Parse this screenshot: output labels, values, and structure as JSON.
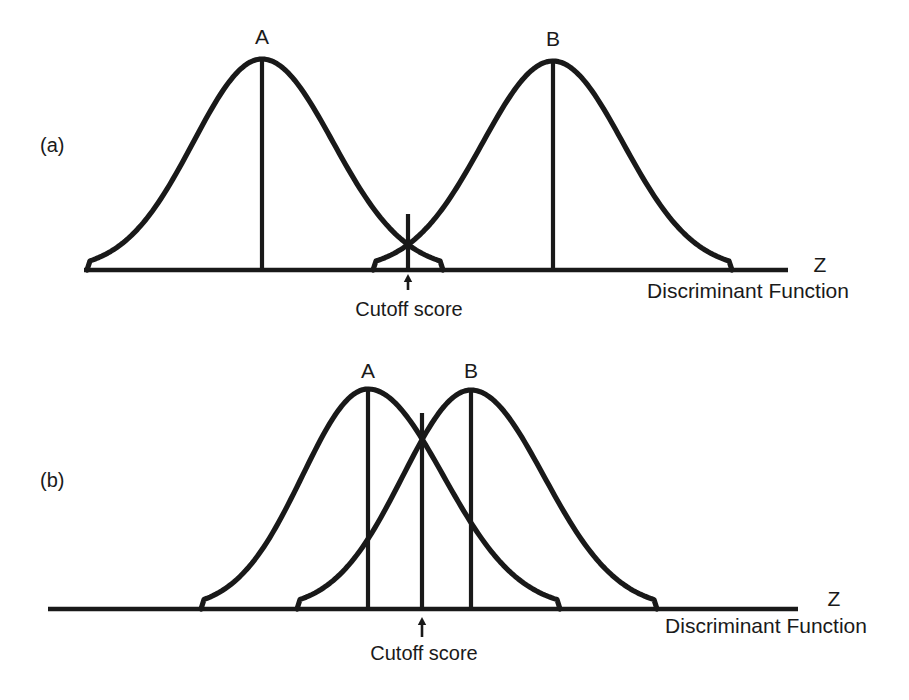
{
  "figure": {
    "background_color": "#ffffff",
    "stroke_color": "#191919",
    "text_color": "#1a1a1a"
  },
  "panels": [
    {
      "id": "panel-a",
      "label": "(a)",
      "label_x": 40,
      "label_y": 152,
      "baseline_y": 270,
      "axis_x_start": 84,
      "axis_x_end": 788,
      "axis_name": "Z",
      "axis_name_x": 820,
      "axis_name_y": 272,
      "axis_caption": "Discriminant Function",
      "axis_caption_x": 748,
      "axis_caption_y": 298,
      "cutoff_label": "Cutoff score",
      "cutoff_label_x": 409,
      "cutoff_label_y": 316,
      "cutoff_x": 408,
      "cutoff_top_y": 214,
      "arrow_x": 408,
      "arrow_tip_y": 274,
      "arrow_tail_y": 290,
      "groups": [
        {
          "name": "A",
          "label_x": 262,
          "label_y": 44,
          "peak_x": 262,
          "peak_y": 59,
          "left_foot_x": 87,
          "right_foot_x": 443
        },
        {
          "name": "B",
          "label_x": 553,
          "label_y": 46,
          "peak_x": 553,
          "peak_y": 61,
          "left_foot_x": 373,
          "right_foot_x": 732
        }
      ]
    },
    {
      "id": "panel-b",
      "label": "(b)",
      "label_x": 40,
      "label_y": 487,
      "baseline_y": 609,
      "axis_x_start": 48,
      "axis_x_end": 798,
      "axis_name": "Z",
      "axis_name_x": 834,
      "axis_name_y": 606,
      "axis_caption": "Discriminant Function",
      "axis_caption_x": 766,
      "axis_caption_y": 633,
      "cutoff_label": "Cutoff score",
      "cutoff_label_x": 424,
      "cutoff_label_y": 660,
      "cutoff_x": 422,
      "cutoff_top_y": 413,
      "arrow_x": 422,
      "arrow_tip_y": 617,
      "arrow_tail_y": 637,
      "groups": [
        {
          "name": "A",
          "label_x": 368,
          "label_y": 378,
          "peak_x": 368,
          "peak_y": 389,
          "left_foot_x": 201,
          "right_foot_x": 560
        },
        {
          "name": "B",
          "label_x": 471,
          "label_y": 378,
          "peak_x": 471,
          "peak_y": 390,
          "left_foot_x": 297,
          "right_foot_x": 657
        }
      ]
    }
  ],
  "chart_data": {
    "type": "line",
    "title": "",
    "xlabel": "Discriminant Function",
    "ylabel": "",
    "series": [
      {
        "panel": "(a)",
        "name": "A",
        "shape": "normal-curve",
        "mean_x": 262,
        "left_tail_x": 87,
        "right_tail_x": 443,
        "peak_height_px": 211
      },
      {
        "panel": "(a)",
        "name": "B",
        "shape": "normal-curve",
        "mean_x": 553,
        "left_tail_x": 373,
        "right_tail_x": 732,
        "peak_height_px": 209
      },
      {
        "panel": "(b)",
        "name": "A",
        "shape": "normal-curve",
        "mean_x": 368,
        "left_tail_x": 201,
        "right_tail_x": 560,
        "peak_height_px": 220
      },
      {
        "panel": "(b)",
        "name": "B",
        "shape": "normal-curve",
        "mean_x": 471,
        "left_tail_x": 297,
        "right_tail_x": 657,
        "peak_height_px": 219
      }
    ],
    "annotations": [
      {
        "panel": "(a)",
        "text": "Cutoff score",
        "x": 408,
        "note": "intersection of curves A and B, small overlap"
      },
      {
        "panel": "(b)",
        "text": "Cutoff score",
        "x": 422,
        "note": "intersection of curves A and B, large overlap"
      }
    ],
    "legend_position": "none",
    "grid": false
  }
}
